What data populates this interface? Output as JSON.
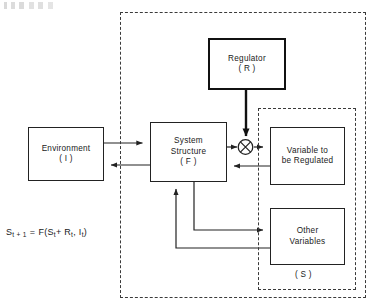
{
  "diagram": {
    "title_artifact": "",
    "boxes": {
      "regulator": {
        "line1": "Regulator",
        "line2": "( R )"
      },
      "environment": {
        "line1": "Environment",
        "line2": "( I )"
      },
      "system_structure": {
        "line1": "System",
        "line2": "Structure",
        "line3": "( F )"
      },
      "variable_regulated": {
        "line1": "Variable to",
        "line2": "be  Regulated"
      },
      "other_variables": {
        "line1": "Other",
        "line2": "Variables"
      }
    },
    "labels": {
      "state_group": "( S )"
    },
    "equation": {
      "lhs_base": "S",
      "lhs_sub": "t + 1",
      "eq": "=",
      "fn": "F(S",
      "fn_sub1": "t",
      "plus": "+ R",
      "fn_sub2": "t",
      "comma": ", I",
      "fn_sub3": "t",
      "close": ")"
    },
    "nodes": {
      "summing_junction": "+"
    },
    "colors": {
      "stroke": "#222222",
      "thick_stroke": "#111111",
      "dashed": "#3a3a3a",
      "background": "#ffffff"
    }
  }
}
